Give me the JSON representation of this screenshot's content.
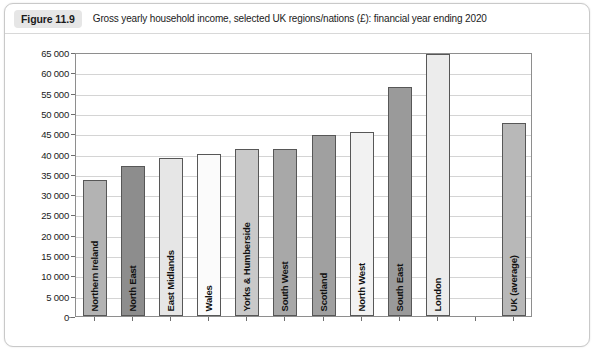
{
  "figure": {
    "badge": "Figure 11.9",
    "caption": "Gross yearly household income, selected UK regions/nations (£): financial year ending 2020"
  },
  "chart_data": {
    "type": "bar",
    "title": "Gross yearly household income, selected UK regions/nations (£): financial year ending 2020",
    "xlabel": "",
    "ylabel": "",
    "ylim": [
      0,
      65000
    ],
    "grid": true,
    "legend": "none",
    "ytick_labels": [
      "65 000",
      "60 000",
      "55 000",
      "50 000",
      "45 000",
      "40 000",
      "35 000",
      "30 000",
      "25 000",
      "20 000",
      "15 000",
      "10 000",
      "5 000",
      "0"
    ],
    "ytick_values": [
      65000,
      60000,
      55000,
      50000,
      45000,
      40000,
      35000,
      30000,
      25000,
      20000,
      15000,
      10000,
      5000,
      0
    ],
    "categories": [
      "Northern Ireland",
      "North East",
      "East Midlands",
      "Wales",
      "Yorks & Humberside",
      "South West",
      "Scotland",
      "North West",
      "South East",
      "London",
      "UK (average)"
    ],
    "values": [
      33500,
      37000,
      39000,
      40000,
      41000,
      41200,
      44500,
      45300,
      56300,
      64500,
      47500
    ],
    "bar_colors": [
      "#b3b3b3",
      "#8d8d8d",
      "#e6e6e6",
      "#fbfbfb",
      "#c9c9c9",
      "#a8a8a8",
      "#a0a0a0",
      "#f2f2f2",
      "#9a9a9a",
      "#ececec",
      "#b8b8b8"
    ],
    "gap_before_last": true
  }
}
